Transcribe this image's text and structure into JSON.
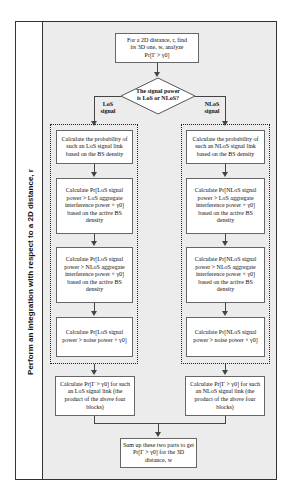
{
  "side_label": "Perform an integration with respect to a 2D distance, r",
  "start": {
    "line1": "For a 2D distance, r, find",
    "line2": "its 3D one, w, analyze",
    "line3": "Pr[Γ > γ0]"
  },
  "decision": {
    "line1": "The signal power",
    "line2": "is LoS or NLoS?"
  },
  "branches": {
    "los": "LoS signal",
    "nlos": "NLoS signal"
  },
  "los": {
    "box1": "Calculate the probability of such an LoS signal link based on the BS density",
    "box2": "Calculate Pr[LoS signal power > LoS aggregate interference power × γ0] based on the active BS density",
    "box3": "Calculate Pr[LoS signal power > NLoS aggregate interference power × γ0] based on the active BS density",
    "box4": "Calculate Pr[LoS signal power > noise power × γ0]",
    "result": "Calculate Pr[Γ > γ0] for such an LoS signal link (the product of the above four blocks)"
  },
  "nlos": {
    "box1": "Calculate the probability of such an NLoS signal link based on the BS density",
    "box2": "Calculate Pr[NLoS signal power > LoS aggregate interference power × γ0] based on the active BS density",
    "box3": "Calculate Pr[NLoS signal power > NLoS aggregate interference power × γ0] based on the active BS density",
    "box4": "Calculate Pr[NLoS signal power > noise power × γ0]",
    "result": "Calculate Pr[Γ > γ0] for such an NLoS signal link (the product of the above four blocks)"
  },
  "final": "Sum up these two parts to get Pr[Γ > γ0] for the 3D distance, w"
}
